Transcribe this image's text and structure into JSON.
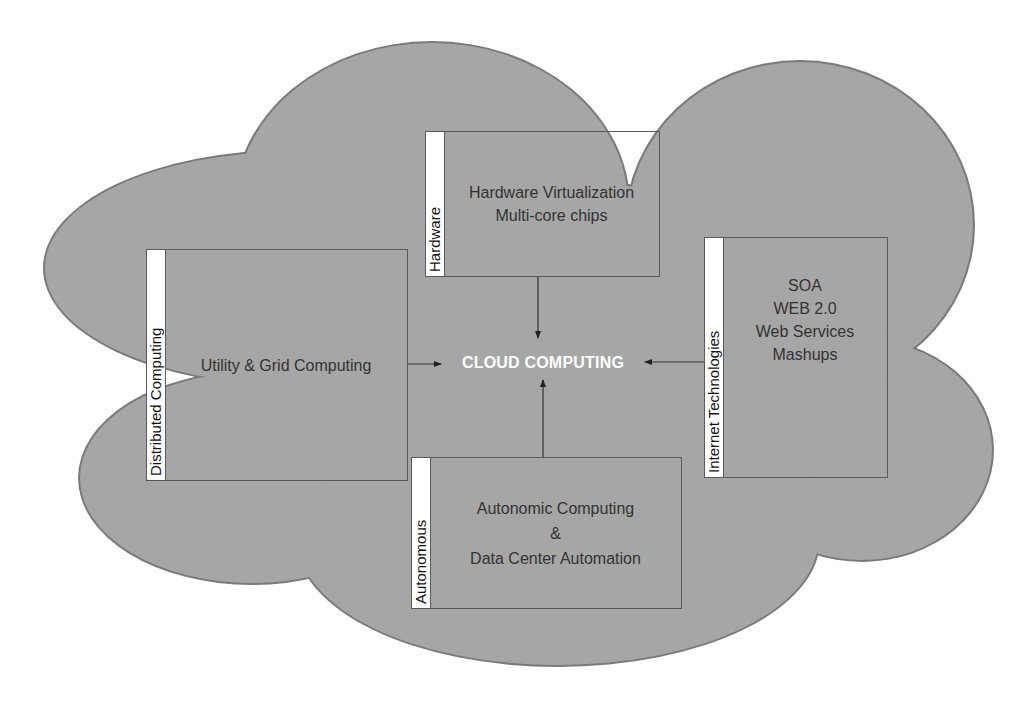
{
  "diagram": {
    "type": "cloud-concept-diagram",
    "center": {
      "label": "CLOUD COMPUTING"
    },
    "colors": {
      "cloud_fill": "#a6a6a6",
      "cloud_stroke": "#7a7a7a",
      "box_border": "#5a5a5a",
      "label_strip": "#ffffff",
      "center_text": "#ffffff",
      "body_text": "#333333"
    },
    "boxes": [
      {
        "id": "hardware",
        "category": "Hardware",
        "lines": [
          "Hardware Virtualization",
          "Multi-core chips"
        ]
      },
      {
        "id": "distributed",
        "category": "Distributed Computing",
        "lines": [
          "Utility & Grid Computing"
        ]
      },
      {
        "id": "internet",
        "category": "Internet Technologies",
        "lines": [
          "SOA",
          "WEB 2.0",
          "Web Services",
          "Mashups"
        ]
      },
      {
        "id": "autonomous",
        "category": "Autonomous",
        "lines": [
          "Autonomic Computing",
          "&",
          "Data Center Automation"
        ]
      }
    ],
    "edges": [
      {
        "from": "hardware",
        "to": "center"
      },
      {
        "from": "distributed",
        "to": "center"
      },
      {
        "from": "internet",
        "to": "center"
      },
      {
        "from": "autonomous",
        "to": "center"
      }
    ]
  }
}
